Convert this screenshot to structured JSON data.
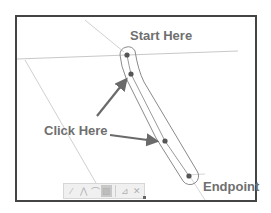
{
  "labels": {
    "start": "Start Here",
    "click": "Click Here",
    "end": "Endpoint"
  },
  "colors": {
    "frame_border": "#444444",
    "guide_line": "#c8c8c8",
    "spline_outline": "#8a8a8a",
    "point_fill": "#555555",
    "arrow": "#6a6a6a",
    "label_text": "#6f6f6f"
  },
  "toolbar": {
    "tools": [
      {
        "name": "line-tool",
        "glyph": "⁄"
      },
      {
        "name": "polyline-tool",
        "glyph": "⋀"
      },
      {
        "name": "arc-tool",
        "glyph": "⌒"
      },
      {
        "name": "spline-tool",
        "glyph": "▨"
      },
      {
        "name": "close-tool",
        "glyph": "⊿"
      },
      {
        "name": "cancel-tool",
        "glyph": "✕"
      }
    ]
  },
  "points": [
    {
      "id": "start",
      "x": 127,
      "y": 55
    },
    {
      "id": "click-1",
      "x": 131,
      "y": 74
    },
    {
      "id": "click-2",
      "x": 165,
      "y": 141
    },
    {
      "id": "end",
      "x": 189,
      "y": 176
    }
  ]
}
